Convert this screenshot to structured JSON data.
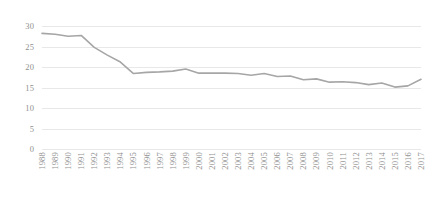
{
  "chart_data": {
    "type": "line",
    "title": "",
    "subtitle": "",
    "xlabel": "",
    "ylabel": "",
    "grid": true,
    "legend": false,
    "legend_position": "none",
    "line_color": "#a6a6a6",
    "gridline_color": "#e8e8e8",
    "text_color": "#8f8f8f",
    "background_color": "#ffffff",
    "xlim": [
      1988,
      2017
    ],
    "ylim": [
      0,
      30
    ],
    "y_ticks": [
      0,
      5,
      10,
      15,
      20,
      25,
      30
    ],
    "y_tick_labels": [
      "0",
      "5",
      "10",
      "15",
      "20",
      "25",
      "30"
    ],
    "categories": [
      "1988",
      "1989",
      "1990",
      "1991",
      "1992",
      "1993",
      "1994",
      "1995",
      "1996",
      "1997",
      "1998",
      "1999",
      "2000",
      "2001",
      "2002",
      "2003",
      "2004",
      "2005",
      "2006",
      "2007",
      "2008",
      "2009",
      "2010",
      "2011",
      "2012",
      "2013",
      "2014",
      "2015",
      "2016",
      "2017"
    ],
    "values": [
      28.2,
      28.0,
      27.5,
      27.7,
      24.8,
      22.9,
      21.2,
      18.4,
      18.7,
      18.8,
      19.0,
      19.5,
      18.5,
      18.5,
      18.5,
      18.4,
      18.0,
      18.4,
      17.7,
      17.8,
      16.9,
      17.1,
      16.3,
      16.4,
      16.2,
      15.7,
      16.1,
      15.1,
      15.4,
      17.0
    ],
    "series": [
      {
        "name": "series-1",
        "values": [
          28.2,
          28.0,
          27.5,
          27.7,
          24.8,
          22.9,
          21.2,
          18.4,
          18.7,
          18.8,
          19.0,
          19.5,
          18.5,
          18.5,
          18.5,
          18.4,
          18.0,
          18.4,
          17.7,
          17.8,
          16.9,
          17.1,
          16.3,
          16.4,
          16.2,
          15.7,
          16.1,
          15.1,
          15.4,
          17.0
        ]
      }
    ]
  }
}
